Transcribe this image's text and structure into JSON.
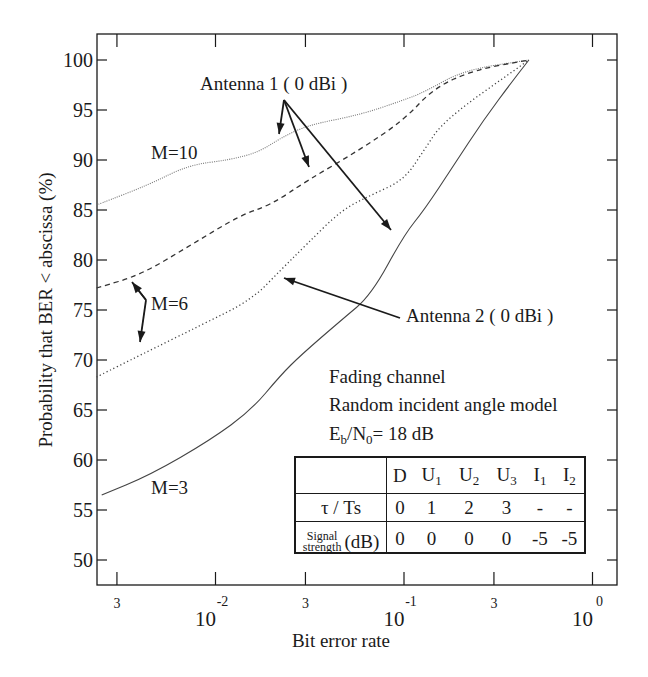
{
  "chart_data": {
    "type": "line",
    "title": "",
    "xlabel": "Bit error rate",
    "ylabel": "Probability that BER < abscissa  (%)",
    "xscale": "log",
    "xlim": [
      0.00234,
      1.34
    ],
    "ylim": [
      47.5,
      102.6
    ],
    "grid": false,
    "x_ticks": [
      {
        "value": 0.003,
        "label": "3"
      },
      {
        "value": 0.01,
        "label": "10",
        "exp": "-2"
      },
      {
        "value": 0.03,
        "label": "3"
      },
      {
        "value": 0.1,
        "label": "10",
        "exp": "-1"
      },
      {
        "value": 0.3,
        "label": "3"
      },
      {
        "value": 1.0,
        "label": "10",
        "exp": "0"
      }
    ],
    "y_ticks": [
      50,
      55,
      60,
      65,
      70,
      75,
      80,
      85,
      90,
      95,
      100
    ],
    "series": [
      {
        "name": "M=10 (Antenna 1, 0 dBi)",
        "style": "fine-dotted",
        "x": [
          0.00234,
          0.0044,
          0.0072,
          0.0118,
          0.017,
          0.0222,
          0.031,
          0.058,
          0.1,
          0.128,
          0.209,
          0.46
        ],
        "y": [
          85.5,
          87.5,
          89.5,
          90.0,
          90.8,
          92.2,
          93.5,
          94.5,
          96.0,
          96.8,
          99.0,
          100.0
        ]
      },
      {
        "name": "M=6 (Antenna 1, 0 dBi)",
        "style": "dashed",
        "x": [
          0.00234,
          0.004,
          0.0074,
          0.0136,
          0.0196,
          0.031,
          0.058,
          0.1,
          0.144,
          0.235,
          0.46
        ],
        "y": [
          77.2,
          78.5,
          81.5,
          84.5,
          85.5,
          88.0,
          91.0,
          94.0,
          97.2,
          99.0,
          100.0
        ]
      },
      {
        "name": "M=6 (Antenna 2, 0 dBi)",
        "style": "dotted",
        "x": [
          0.00234,
          0.004,
          0.0084,
          0.0155,
          0.0222,
          0.0302,
          0.0466,
          0.067,
          0.1,
          0.128,
          0.163,
          0.46
        ],
        "y": [
          68.3,
          70.5,
          73.5,
          76.0,
          79.0,
          81.5,
          85.0,
          86.5,
          88.0,
          91.0,
          94.0,
          100.0
        ]
      },
      {
        "name": "M=3",
        "style": "solid",
        "x": [
          0.00249,
          0.0045,
          0.0094,
          0.0155,
          0.0222,
          0.0284,
          0.0466,
          0.067,
          0.1,
          0.128,
          0.184,
          0.264,
          0.38,
          0.46
        ],
        "y": [
          56.5,
          58.5,
          62.0,
          65.0,
          68.5,
          70.5,
          74.0,
          76.5,
          82.5,
          85.0,
          89.5,
          94.0,
          98.0,
          100.0
        ]
      }
    ],
    "annotations": [
      {
        "text": "Antenna 1 ( 0 dBi )",
        "arrows_to": [
          "M=10",
          "M=6 dashed",
          "M=3"
        ]
      },
      {
        "text": "Antenna 2 ( 0 dBi )",
        "arrows_to": [
          "M=6 dotted"
        ]
      },
      {
        "text": "M=10"
      },
      {
        "text": "M=6"
      },
      {
        "text": "M=3"
      }
    ]
  },
  "labels": {
    "antenna1": "Antenna 1 ( 0 dBi )",
    "antenna2": "Antenna 2 ( 0 dBi )",
    "m10": "M=10",
    "m6": "M=6",
    "m3": "M=3",
    "condition1": "Fading channel",
    "condition2": "Random incident angle model",
    "ebn0_prefix_E": "E",
    "ebn0_sub_b": "b",
    "ebn0_slash_N": "/N",
    "ebn0_sub_0": "0",
    "ebn0_value": "= 18 dB",
    "xlabel": "Bit error rate",
    "ylabel": "Probability that BER < abscissa  (%)"
  },
  "table": {
    "headers": [
      {
        "main": "D",
        "sub": ""
      },
      {
        "main": "U",
        "sub": "1"
      },
      {
        "main": "U",
        "sub": "2"
      },
      {
        "main": "U",
        "sub": "3"
      },
      {
        "main": "I",
        "sub": "1"
      },
      {
        "main": "I",
        "sub": "2"
      }
    ],
    "row_tau": {
      "label": "τ / Ts",
      "values": [
        "0",
        "1",
        "2",
        "3",
        "-",
        "-"
      ]
    },
    "row_signal": {
      "label_small_1": "Signal",
      "label_small_2": "strength",
      "label_unit": "(dB)",
      "values": [
        "0",
        "0",
        "0",
        "0",
        "-5",
        "-5"
      ]
    }
  },
  "colors": {
    "ink": "#1a1a1a",
    "curve_light": "#555555",
    "background": "#ffffff"
  }
}
